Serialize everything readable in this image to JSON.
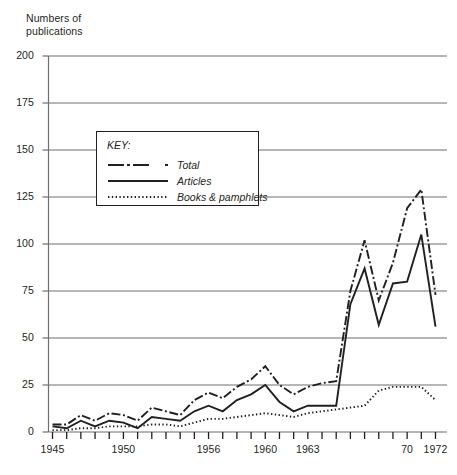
{
  "chart_data": {
    "type": "line",
    "title": "",
    "ylabel": "Numbers of\npublications",
    "xlabel": "",
    "ylim": [
      0,
      200
    ],
    "xlim": [
      1945,
      1973
    ],
    "grid": true,
    "grid_axis": "y",
    "legend_position": "inside-upper-left",
    "legend_title": "KEY:",
    "y_ticks": [
      200,
      175,
      150,
      125,
      100,
      75,
      50,
      25,
      0
    ],
    "x_ticks": [
      1945,
      1946,
      1947,
      1948,
      1949,
      1950,
      1951,
      1952,
      1953,
      1954,
      1955,
      1956,
      1957,
      1958,
      1959,
      1960,
      1961,
      1962,
      1963,
      1964,
      1965,
      1966,
      1967,
      1968,
      1969,
      1970,
      1971,
      1972
    ],
    "x_tick_labels": [
      {
        "x": 1945,
        "label": "1945"
      },
      {
        "x": 1950,
        "label": "1950"
      },
      {
        "x": 1956,
        "label": "1956"
      },
      {
        "x": 1960,
        "label": "1960"
      },
      {
        "x": 1963,
        "label": "1963"
      },
      {
        "x": 1970,
        "label": "70"
      },
      {
        "x": 1972,
        "label": "1972"
      }
    ],
    "x": [
      1945,
      1946,
      1947,
      1948,
      1949,
      1950,
      1951,
      1952,
      1953,
      1954,
      1955,
      1956,
      1957,
      1958,
      1959,
      1960,
      1961,
      1962,
      1963,
      1964,
      1965,
      1966,
      1967,
      1968,
      1969,
      1970,
      1971,
      1972
    ],
    "series": [
      {
        "name": "Total",
        "style": "dash-dot",
        "color": "#231f20",
        "values": [
          4,
          4,
          9,
          6,
          10,
          9,
          6,
          13,
          11,
          9,
          17,
          21,
          18,
          24,
          28,
          35,
          25,
          20,
          24,
          26,
          27,
          75,
          102,
          70,
          90,
          119,
          129,
          73
        ]
      },
      {
        "name": "Articles",
        "style": "solid",
        "color": "#231f20",
        "values": [
          3,
          2,
          6,
          3,
          6,
          5,
          2,
          8,
          7,
          6,
          11,
          14,
          11,
          17,
          20,
          25,
          16,
          11,
          14,
          14,
          14,
          68,
          87,
          57,
          79,
          80,
          105,
          56
        ]
      },
      {
        "name": "Books & pamphlets",
        "style": "dotted",
        "color": "#231f20",
        "values": [
          1,
          1,
          2,
          2,
          3,
          3,
          3,
          4,
          4,
          3,
          5,
          7,
          7,
          8,
          9,
          10,
          9,
          8,
          10,
          11,
          12,
          13,
          14,
          22,
          24,
          24,
          24,
          17
        ]
      }
    ]
  }
}
